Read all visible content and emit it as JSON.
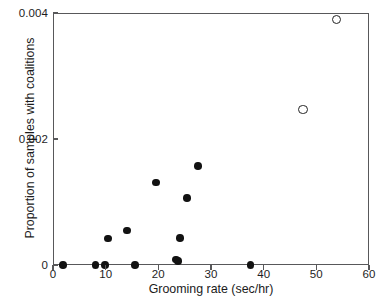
{
  "chart_data": {
    "type": "scatter",
    "title": "",
    "xlabel": "Grooming rate (sec/hr)",
    "ylabel": "Proportion of samples with coalitions",
    "xlim": [
      0,
      60
    ],
    "ylim": [
      0,
      0.004
    ],
    "xticks": [
      0,
      10,
      20,
      30,
      40,
      50,
      60
    ],
    "xtick_labels": [
      "0",
      "10",
      "20",
      "30",
      "40",
      "50",
      "60"
    ],
    "yticks": [
      0,
      0.002,
      0.004
    ],
    "ytick_labels": [
      "0",
      "0.002",
      "0.004"
    ],
    "grid": false,
    "legend": false,
    "legend_position": "none",
    "series": [
      {
        "name": "filled",
        "marker": "filled-circle",
        "color": "#121212",
        "points": [
          {
            "x": 1.9,
            "y": 0.0
          },
          {
            "x": 8.1,
            "y": 0.0
          },
          {
            "x": 9.9,
            "y": 0.0
          },
          {
            "x": 10.4,
            "y": 0.00042
          },
          {
            "x": 14.0,
            "y": 0.00055
          },
          {
            "x": 15.6,
            "y": 0.0
          },
          {
            "x": 19.6,
            "y": 0.00131
          },
          {
            "x": 23.3,
            "y": 9e-05
          },
          {
            "x": 23.7,
            "y": 6e-05
          },
          {
            "x": 24.1,
            "y": 0.00043
          },
          {
            "x": 25.4,
            "y": 0.00106
          },
          {
            "x": 27.5,
            "y": 0.00157
          },
          {
            "x": 37.5,
            "y": 0.0
          }
        ]
      },
      {
        "name": "open",
        "marker": "open-circle",
        "color": "#242424",
        "points": [
          {
            "x": 47.5,
            "y": 0.00247
          },
          {
            "x": 53.8,
            "y": 0.0039
          }
        ]
      }
    ]
  }
}
